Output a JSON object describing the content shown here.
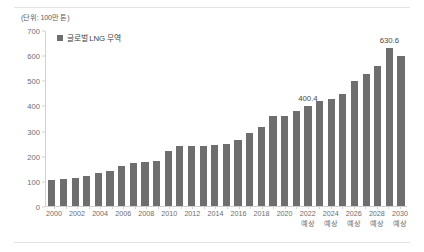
{
  "unit_note": "(단위: 100만 톤)",
  "legend": {
    "label": "글로벌 LNG 무역",
    "color": "#6e6e6e"
  },
  "chart_data": {
    "type": "bar",
    "title": "",
    "subtitle": "",
    "xlabel": "",
    "ylabel": "",
    "unit_note": "(단위: 100만 톤)",
    "ylim": [
      0,
      700
    ],
    "yticks": [
      0,
      100,
      200,
      300,
      400,
      500,
      600,
      700
    ],
    "grid": false,
    "legend_position": "top-left",
    "legend_entries": [
      "글로벌 LNG 무역"
    ],
    "bar_color": "#6e6e6e",
    "forecast_note": "예상",
    "forecast_years": [
      2022,
      2023,
      2024,
      2025,
      2026,
      2027,
      2028,
      2029,
      2030
    ],
    "categories": [
      "2000",
      "2001",
      "2002",
      "2003",
      "2004",
      "2005",
      "2006",
      "2007",
      "2008",
      "2009",
      "2010",
      "2011",
      "2012",
      "2013",
      "2014",
      "2015",
      "2016",
      "2017",
      "2018",
      "2019",
      "2020",
      "2021",
      "2022",
      "2023",
      "2024",
      "2025",
      "2026",
      "2027",
      "2028",
      "2029",
      "2030"
    ],
    "tick_labels": [
      "2000",
      "",
      "2002",
      "",
      "2004",
      "",
      "2006",
      "",
      "2008",
      "",
      "2010",
      "",
      "2012",
      "",
      "2014",
      "",
      "2016",
      "",
      "2018",
      "",
      "2020",
      "",
      "2022",
      "",
      "2024",
      "",
      "2026",
      "",
      "2028",
      "",
      "2030"
    ],
    "tick_notes": [
      "",
      "",
      "",
      "",
      "",
      "",
      "",
      "",
      "",
      "",
      "",
      "",
      "",
      "",
      "",
      "",
      "",
      "",
      "",
      "",
      "",
      "",
      "예상",
      "",
      "예상",
      "",
      "예상",
      "",
      "예상",
      "",
      "예상"
    ],
    "values": [
      103,
      110,
      113,
      122,
      131,
      140,
      159,
      172,
      176,
      181,
      221,
      241,
      239,
      239,
      243,
      250,
      265,
      293,
      318,
      360,
      360,
      380,
      400.4,
      420,
      430,
      450,
      500,
      530,
      560,
      630.6,
      600
    ],
    "data_labels": [
      {
        "category": "2022",
        "value": "400.4"
      },
      {
        "category": "2029",
        "value": "630.6"
      }
    ]
  }
}
